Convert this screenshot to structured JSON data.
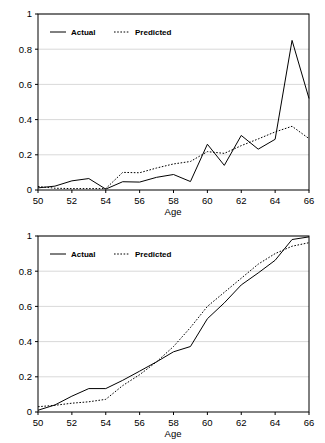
{
  "figure": {
    "panels": [
      {
        "id": "top-panel",
        "name": "chart-top"
      },
      {
        "id": "bottom-panel",
        "name": "chart-bottom"
      }
    ]
  },
  "axis": {
    "x_title": "Age",
    "y_ticks": [
      "0",
      "0.2",
      "0.4",
      "0.6",
      "0.8",
      "1"
    ],
    "x_ticks": [
      "50",
      "52",
      "54",
      "56",
      "58",
      "60",
      "62",
      "64",
      "66"
    ]
  },
  "legend": {
    "actual": "Actual",
    "predicted": "Predicted"
  },
  "colors": {
    "line": "#000000",
    "grid": "#c8c8c8",
    "frame": "#000000",
    "background": "#ffffff"
  },
  "chart_data": [
    {
      "type": "line",
      "id": "top",
      "title": "",
      "xlabel": "Age",
      "ylabel": "",
      "xlim": [
        50,
        66
      ],
      "ylim": [
        0,
        1
      ],
      "xticks": [
        50,
        52,
        54,
        56,
        58,
        60,
        62,
        64,
        66
      ],
      "yticks": [
        0,
        0.2,
        0.4,
        0.6,
        0.8,
        1
      ],
      "grid": "horizontal",
      "legend_position": "top-left",
      "x": [
        50,
        51,
        52,
        53,
        54,
        55,
        56,
        57,
        58,
        59,
        60,
        61,
        62,
        63,
        64,
        65,
        66
      ],
      "series": [
        {
          "name": "Actual",
          "style": "solid",
          "values": [
            0.012,
            0.022,
            0.052,
            0.065,
            0.005,
            0.047,
            0.045,
            0.072,
            0.088,
            0.048,
            0.26,
            0.14,
            0.31,
            0.232,
            0.288,
            0.85,
            0.52
          ]
        },
        {
          "name": "Predicted",
          "style": "dotted",
          "values": [
            0.02,
            0.01,
            0.008,
            0.008,
            0.008,
            0.1,
            0.098,
            0.125,
            0.148,
            0.162,
            0.218,
            0.208,
            0.252,
            0.29,
            0.33,
            0.362,
            0.292
          ]
        }
      ]
    },
    {
      "type": "line",
      "id": "bottom",
      "title": "",
      "xlabel": "Age",
      "ylabel": "",
      "xlim": [
        50,
        66
      ],
      "ylim": [
        0,
        1
      ],
      "xticks": [
        50,
        52,
        54,
        56,
        58,
        60,
        62,
        64,
        66
      ],
      "yticks": [
        0,
        0.2,
        0.4,
        0.6,
        0.8,
        1
      ],
      "grid": "horizontal",
      "legend_position": "top-left",
      "x": [
        50,
        51,
        52,
        53,
        54,
        55,
        56,
        57,
        58,
        59,
        60,
        61,
        62,
        63,
        64,
        65,
        66
      ],
      "series": [
        {
          "name": "Actual",
          "style": "solid",
          "values": [
            0.01,
            0.04,
            0.09,
            0.133,
            0.133,
            0.18,
            0.232,
            0.285,
            0.342,
            0.372,
            0.53,
            0.62,
            0.722,
            0.79,
            0.862,
            0.98,
            0.995
          ]
        },
        {
          "name": "Predicted",
          "style": "dotted",
          "values": [
            0.03,
            0.038,
            0.05,
            0.058,
            0.072,
            0.15,
            0.212,
            0.285,
            0.372,
            0.48,
            0.6,
            0.68,
            0.76,
            0.84,
            0.9,
            0.942,
            0.962
          ]
        }
      ]
    }
  ]
}
